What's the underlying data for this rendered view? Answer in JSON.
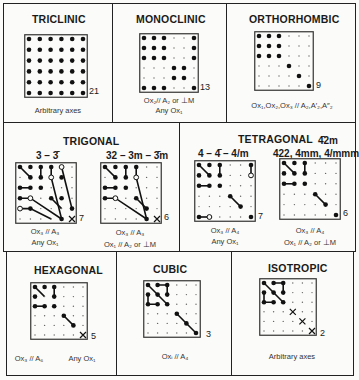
{
  "panels": [
    {
      "id": "triclinic",
      "title": "TRICLINIC",
      "count": "21",
      "captions": [
        "Arbitrary axes"
      ],
      "grid": {
        "filled": "all",
        "open": [],
        "x": [],
        "lines": []
      }
    },
    {
      "id": "monoclinic",
      "title": "MONOCLINIC",
      "count": "13",
      "captions": [
        "Ox₂// A₂ or ⊥M",
        "Any Ox₁"
      ],
      "grid": {
        "filled": [
          [
            0,
            0
          ],
          [
            0,
            1
          ],
          [
            0,
            2
          ],
          [
            0,
            5
          ],
          [
            1,
            0
          ],
          [
            1,
            1
          ],
          [
            1,
            2
          ],
          [
            1,
            5
          ],
          [
            2,
            0
          ],
          [
            2,
            1
          ],
          [
            2,
            2
          ],
          [
            2,
            5
          ],
          [
            3,
            3
          ],
          [
            3,
            4
          ],
          [
            4,
            3
          ],
          [
            4,
            4
          ],
          [
            5,
            0
          ],
          [
            5,
            1
          ],
          [
            5,
            2
          ],
          [
            5,
            5
          ]
        ],
        "open": [],
        "x": [],
        "lines": []
      }
    },
    {
      "id": "orthorhombic",
      "title": "ORTHORHOMBIC",
      "count": "9",
      "captions": [
        "Ox₁,Ox₂,Ox₃ // A₂,A′₂,A″₂"
      ],
      "grid": {
        "filled": [
          [
            0,
            0
          ],
          [
            0,
            1
          ],
          [
            0,
            2
          ],
          [
            1,
            0
          ],
          [
            1,
            1
          ],
          [
            1,
            2
          ],
          [
            2,
            0
          ],
          [
            2,
            1
          ],
          [
            2,
            2
          ],
          [
            3,
            3
          ],
          [
            4,
            4
          ],
          [
            5,
            5
          ]
        ],
        "open": [],
        "x": [],
        "lines": []
      }
    },
    {
      "id": "trigonal-3",
      "group": "TRIGONAL",
      "subtitle": "3 – 3̄",
      "count": "7",
      "captions": [
        "Ox₃ // A₃",
        "Any Ox₁"
      ],
      "grid": {
        "filled": [
          [
            0,
            0
          ],
          [
            0,
            1
          ],
          [
            0,
            2
          ],
          [
            0,
            3
          ],
          [
            1,
            1
          ],
          [
            1,
            2
          ],
          [
            1,
            4
          ],
          [
            2,
            0
          ],
          [
            2,
            1
          ],
          [
            2,
            2
          ],
          [
            3,
            0
          ],
          [
            3,
            3
          ],
          [
            3,
            4
          ],
          [
            4,
            1
          ],
          [
            4,
            5
          ],
          [
            5,
            4
          ]
        ],
        "open": [
          [
            0,
            4
          ],
          [
            1,
            3
          ],
          [
            3,
            1
          ],
          [
            4,
            0
          ]
        ],
        "x": [
          [
            5,
            5
          ]
        ],
        "lines": [
          [
            [
              0,
              0
            ],
            [
              1,
              1
            ]
          ],
          [
            [
              0,
              2
            ],
            [
              1,
              2
            ]
          ],
          [
            [
              0,
              3
            ],
            [
              1,
              3
            ],
            [
              5,
              4
            ]
          ],
          [
            [
              0,
              4
            ],
            [
              4,
              5
            ]
          ],
          [
            [
              2,
              0
            ],
            [
              2,
              1
            ]
          ],
          [
            [
              3,
              0
            ],
            [
              3,
              1
            ],
            [
              5,
              4
            ]
          ],
          [
            [
              3,
              3
            ],
            [
              4,
              4
            ]
          ],
          [
            [
              4,
              0
            ],
            [
              4,
              1
            ],
            [
              5,
              3
            ]
          ]
        ]
      }
    },
    {
      "id": "trigonal-32",
      "group": "TRIGONAL",
      "subtitle": "32 – 3m – 3̄m",
      "count": "6",
      "captions": [
        "Ox₃ // A₃",
        "Ox₁ // A₂ or ⊥M"
      ],
      "grid": {
        "filled": [
          [
            0,
            0
          ],
          [
            0,
            1
          ],
          [
            0,
            2
          ],
          [
            0,
            3
          ],
          [
            1,
            1
          ],
          [
            1,
            2
          ],
          [
            2,
            0
          ],
          [
            2,
            1
          ],
          [
            2,
            2
          ],
          [
            3,
            0
          ],
          [
            3,
            3
          ],
          [
            4,
            4
          ],
          [
            5,
            4
          ]
        ],
        "open": [
          [
            1,
            3
          ],
          [
            3,
            1
          ]
        ],
        "x": [
          [
            5,
            5
          ]
        ],
        "lines": [
          [
            [
              0,
              0
            ],
            [
              1,
              1
            ]
          ],
          [
            [
              0,
              2
            ],
            [
              1,
              2
            ]
          ],
          [
            [
              0,
              3
            ],
            [
              1,
              3
            ],
            [
              5,
              4
            ]
          ],
          [
            [
              2,
              0
            ],
            [
              2,
              1
            ]
          ],
          [
            [
              3,
              0
            ],
            [
              3,
              1
            ],
            [
              5,
              4
            ]
          ],
          [
            [
              3,
              3
            ],
            [
              4,
              4
            ]
          ]
        ]
      }
    },
    {
      "id": "tetragonal-4",
      "group": "TETRAGONAL",
      "subtitle": "4 – 4̄ – 4/m",
      "count": "7",
      "captions": [
        "Ox₃ // A₄",
        "Any Ox₁"
      ],
      "grid": {
        "filled": [
          [
            0,
            0
          ],
          [
            0,
            1
          ],
          [
            0,
            2
          ],
          [
            0,
            5
          ],
          [
            1,
            0
          ],
          [
            1,
            1
          ],
          [
            1,
            2
          ],
          [
            2,
            0
          ],
          [
            2,
            1
          ],
          [
            2,
            2
          ],
          [
            3,
            3
          ],
          [
            4,
            4
          ],
          [
            5,
            0
          ],
          [
            5,
            5
          ]
        ],
        "open": [
          [
            1,
            5
          ],
          [
            5,
            1
          ]
        ],
        "x": [],
        "lines": [
          [
            [
              0,
              0
            ],
            [
              1,
              1
            ]
          ],
          [
            [
              0,
              2
            ],
            [
              1,
              2
            ]
          ],
          [
            [
              0,
              5
            ],
            [
              1,
              5
            ]
          ],
          [
            [
              2,
              0
            ],
            [
              2,
              1
            ]
          ],
          [
            [
              3,
              3
            ],
            [
              4,
              4
            ]
          ],
          [
            [
              5,
              0
            ],
            [
              5,
              1
            ]
          ]
        ]
      }
    },
    {
      "id": "tetragonal-422",
      "group": "TETRAGONAL",
      "subtitle": "422, 4mm, 4/mmm",
      "count": "6",
      "captions": [
        "Ox₃ // A₄",
        "Ox₁ // A₂ or ⊥M"
      ],
      "grid": {
        "filled": [
          [
            0,
            0
          ],
          [
            0,
            1
          ],
          [
            0,
            2
          ],
          [
            1,
            0
          ],
          [
            1,
            1
          ],
          [
            1,
            2
          ],
          [
            2,
            0
          ],
          [
            2,
            1
          ],
          [
            2,
            2
          ],
          [
            3,
            3
          ],
          [
            4,
            4
          ],
          [
            5,
            5
          ]
        ],
        "open": [],
        "x": [],
        "lines": [
          [
            [
              0,
              0
            ],
            [
              1,
              1
            ]
          ],
          [
            [
              0,
              2
            ],
            [
              1,
              2
            ]
          ],
          [
            [
              2,
              0
            ],
            [
              2,
              1
            ]
          ],
          [
            [
              3,
              3
            ],
            [
              4,
              4
            ]
          ]
        ]
      }
    },
    {
      "id": "hexagonal",
      "title": "HEXAGONAL",
      "count": "5",
      "captions": [
        "Ox₃ // A₆",
        "Any Ox₁"
      ],
      "grid": {
        "filled": [
          [
            0,
            0
          ],
          [
            0,
            1
          ],
          [
            0,
            2
          ],
          [
            1,
            0
          ],
          [
            1,
            2
          ],
          [
            2,
            0
          ],
          [
            2,
            1
          ],
          [
            2,
            2
          ],
          [
            3,
            3
          ],
          [
            4,
            4
          ]
        ],
        "open": [],
        "x": [
          [
            5,
            5
          ]
        ],
        "lines": [
          [
            [
              0,
              0
            ],
            [
              1,
              1
            ]
          ],
          [
            [
              0,
              2
            ],
            [
              1,
              2
            ]
          ],
          [
            [
              2,
              0
            ],
            [
              2,
              1
            ]
          ],
          [
            [
              3,
              3
            ],
            [
              4,
              4
            ]
          ]
        ]
      }
    },
    {
      "id": "cubic",
      "title": "CUBIC",
      "count": "3",
      "captions": [
        "Oxᵢ // A₄"
      ],
      "grid": {
        "filled": [
          [
            0,
            0
          ],
          [
            0,
            1
          ],
          [
            0,
            2
          ],
          [
            1,
            0
          ],
          [
            1,
            1
          ],
          [
            1,
            2
          ],
          [
            2,
            0
          ],
          [
            2,
            1
          ],
          [
            2,
            2
          ],
          [
            3,
            3
          ],
          [
            4,
            4
          ],
          [
            5,
            5
          ]
        ],
        "open": [],
        "x": [],
        "lines": [
          [
            [
              0,
              0
            ],
            [
              2,
              2
            ]
          ],
          [
            [
              0,
              1
            ],
            [
              0,
              2
            ],
            [
              1,
              2
            ]
          ],
          [
            [
              1,
              0
            ],
            [
              2,
              0
            ],
            [
              2,
              1
            ]
          ],
          [
            [
              3,
              3
            ],
            [
              5,
              5
            ]
          ]
        ]
      }
    },
    {
      "id": "isotropic",
      "title": "ISOTROPIC",
      "count": "2",
      "captions": [
        "Arbitrary axes"
      ],
      "grid": {
        "filled": [
          [
            0,
            0
          ],
          [
            0,
            1
          ],
          [
            0,
            2
          ],
          [
            1,
            0
          ],
          [
            1,
            1
          ],
          [
            1,
            2
          ],
          [
            2,
            0
          ],
          [
            2,
            1
          ],
          [
            2,
            2
          ]
        ],
        "open": [],
        "x": [
          [
            3,
            3
          ],
          [
            4,
            4
          ],
          [
            5,
            5
          ]
        ],
        "lines": [
          [
            [
              0,
              0
            ],
            [
              2,
              2
            ]
          ],
          [
            [
              0,
              1
            ],
            [
              0,
              2
            ],
            [
              1,
              2
            ]
          ],
          [
            [
              1,
              0
            ],
            [
              2,
              0
            ],
            [
              2,
              1
            ]
          ]
        ]
      }
    }
  ],
  "groups": {
    "trigonal": "TRIGONAL",
    "tetragonal": "TETRAGONAL",
    "tetragonal_extra": "4̄2m"
  }
}
